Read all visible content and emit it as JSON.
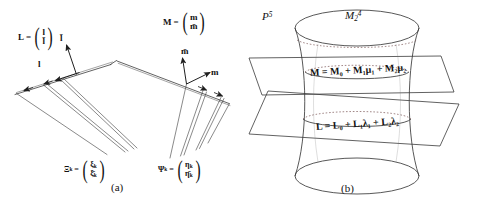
{
  "figure": {
    "panel_a": {
      "caption": "(a)",
      "vector_L": {
        "name": "L",
        "eq": "=",
        "top": "l",
        "bottom": "l̄"
      },
      "vector_M": {
        "name": "M",
        "eq": "=",
        "top": "m",
        "bottom": "m̄"
      },
      "arrow_labels": {
        "l_bar": "l̄",
        "l": "l",
        "m_bar": "m̄",
        "m": "m"
      },
      "vector_Xi": {
        "name": "Ξ",
        "sub": "k",
        "eq": "=",
        "top": "ξ",
        "top_sub": "k",
        "bottom": "ξ̄",
        "bottom_sub": "k"
      },
      "vector_Psi": {
        "name": "Ψ",
        "sub": "k",
        "eq": "=",
        "top": "η",
        "top_sub": "k",
        "bottom": "η̄",
        "bottom_sub": "k"
      }
    },
    "panel_b": {
      "caption": "(b)",
      "space_label": {
        "base": "P",
        "sup": "5"
      },
      "surface_label": {
        "base": "M",
        "sub": "2",
        "sup": "4"
      },
      "plane_upper_equation": "M = M₀ + M₁μ₁ + M₂μ₂",
      "plane_lower_equation": "L = L₀ + L₁λ₁ + L₂λ₂"
    }
  },
  "style": {
    "stroke": "#2b2b2b",
    "stroke_light": "#4a4a4a",
    "background": "#ffffff"
  }
}
